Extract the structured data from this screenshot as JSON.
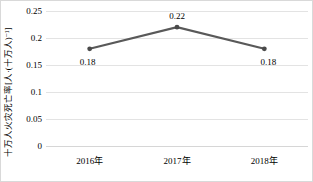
{
  "chart_data": {
    "type": "line",
    "title": "",
    "xlabel": "",
    "ylabel": "十万人火灾死亡率[人·(十万人)⁻¹]",
    "categories": [
      "2016年",
      "2017年",
      "2018年"
    ],
    "values": [
      0.18,
      0.22,
      0.18
    ],
    "point_labels": [
      "0.18",
      "0.22",
      "0.18"
    ],
    "series": [
      {
        "name": "十万人火灾死亡率",
        "values": [
          0.18,
          0.22,
          0.18
        ]
      }
    ],
    "ylim": [
      0,
      0.25
    ],
    "yticks": [
      0,
      0.05,
      0.1,
      0.15,
      0.2,
      0.25
    ],
    "ytick_labels": [
      "0",
      "0.05",
      "0.1",
      "0.15",
      "0.2",
      "0.25"
    ],
    "grid": true,
    "grid_axis": "y",
    "legend": false,
    "legend_position": "none",
    "markers": true,
    "colors": {
      "line": "#595959",
      "marker": "#4a4a4a",
      "gridline": "#e3e3e3",
      "axis": "#d6d6d6",
      "text": "#000000",
      "background": "#ffffff",
      "frame": "#d9d9d9"
    }
  }
}
